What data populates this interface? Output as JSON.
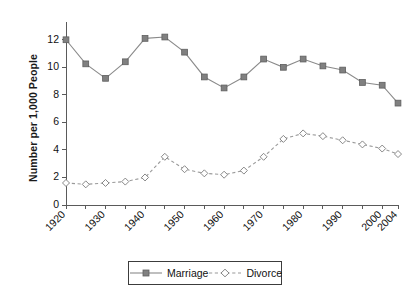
{
  "chart_data": {
    "type": "line",
    "title": "",
    "xlabel": "",
    "ylabel": "Number per 1,000 People",
    "ylim": [
      0,
      13
    ],
    "xlim": [
      1920,
      2004
    ],
    "yticks": [
      0,
      2,
      4,
      6,
      8,
      10,
      12
    ],
    "ytick_labels": [
      "0",
      "2",
      "4",
      "6",
      "8",
      "10",
      "12"
    ],
    "xticks": [
      1920,
      1925,
      1930,
      1935,
      1940,
      1945,
      1950,
      1955,
      1960,
      1965,
      1970,
      1975,
      1980,
      1985,
      1990,
      1995,
      2000,
      2004
    ],
    "xtick_labels": [
      "1920",
      "1930",
      "1940",
      "1950",
      "1960",
      "1970",
      "1980",
      "1990",
      "2000",
      "2004"
    ],
    "labeled_xticks": [
      1920,
      1930,
      1940,
      1950,
      1960,
      1970,
      1980,
      1990,
      2000,
      2004
    ],
    "grid": false,
    "legend_position": "bottom",
    "x": [
      1920,
      1925,
      1930,
      1935,
      1940,
      1945,
      1950,
      1955,
      1960,
      1965,
      1970,
      1975,
      1980,
      1985,
      1990,
      1995,
      2000,
      2004
    ],
    "series": [
      {
        "name": "Marriage",
        "marker": "square",
        "linestyle": "solid",
        "color": "#808080",
        "values": [
          12.0,
          10.25,
          9.2,
          10.4,
          12.1,
          12.2,
          11.1,
          9.3,
          8.5,
          9.3,
          10.6,
          10.0,
          10.6,
          10.1,
          9.8,
          8.9,
          8.7,
          7.4
        ]
      },
      {
        "name": "Divorce",
        "marker": "diamond",
        "linestyle": "dashed",
        "color": "#9a9a9a",
        "values": [
          1.6,
          1.5,
          1.6,
          1.7,
          2.0,
          3.5,
          2.6,
          2.3,
          2.2,
          2.5,
          3.5,
          4.8,
          5.2,
          5.0,
          4.7,
          4.4,
          4.1,
          3.7
        ]
      }
    ]
  },
  "legend": {
    "items": [
      {
        "label": "Marriage"
      },
      {
        "label": "Divorce"
      }
    ]
  }
}
